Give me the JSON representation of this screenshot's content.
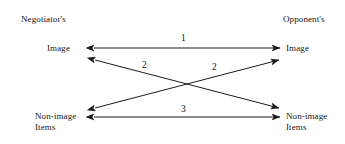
{
  "diagram": {
    "columns": {
      "left_header": "Negotiator's",
      "right_header": "Opponent's"
    },
    "nodes": {
      "left_image": "Image",
      "right_image": "Image",
      "left_nonimage_line1": "Non-image",
      "left_nonimage_line2": "Items",
      "right_nonimage_line1": "Non-image",
      "right_nonimage_line2": "Items"
    },
    "edges": [
      {
        "id": "edge-1",
        "label": "1",
        "from": "left_image",
        "to": "right_image",
        "arrowheads": "both",
        "style": "horizontal"
      },
      {
        "id": "edge-2a",
        "label": "2",
        "from": "left_image",
        "to": "right_nonimage",
        "arrowheads": "both",
        "style": "diagonal-descending"
      },
      {
        "id": "edge-2b",
        "label": "2",
        "from": "left_nonimage",
        "to": "right_image",
        "arrowheads": "both",
        "style": "diagonal-ascending"
      },
      {
        "id": "edge-3",
        "label": "3",
        "from": "left_nonimage",
        "to": "right_nonimage",
        "arrowheads": "both",
        "style": "horizontal"
      }
    ],
    "colors": {
      "background": "#ffffff",
      "line": "#1b1b1b",
      "text": "#151515"
    }
  }
}
